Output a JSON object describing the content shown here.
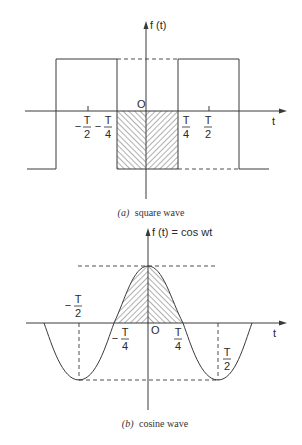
{
  "figure": {
    "panel_a": {
      "caption_letter": "(a)",
      "caption_text": "square wave",
      "y_axis_label": "f (t)",
      "x_axis_label": "t",
      "origin_label": "O",
      "ticks": {
        "neg_half": {
          "sign": "−",
          "num": "T",
          "den": "2"
        },
        "neg_quarter": {
          "sign": "−",
          "num": "T",
          "den": "4"
        },
        "pos_quarter": {
          "num": "T",
          "den": "4"
        },
        "pos_half": {
          "num": "T",
          "den": "2"
        }
      }
    },
    "panel_b": {
      "caption_letter": "(b)",
      "caption_text": "cosine wave",
      "y_axis_label": "f (t) = cos wt",
      "x_axis_label": "t",
      "origin_label": "O",
      "ticks": {
        "neg_half": {
          "sign": "−",
          "num": "T",
          "den": "2"
        },
        "neg_quarter": {
          "sign": "−",
          "num": "T",
          "den": "4"
        },
        "pos_quarter": {
          "num": "T",
          "den": "4"
        },
        "pos_half": {
          "num": "T",
          "den": "2"
        }
      }
    }
  },
  "colors": {
    "line": "#3a3a3a",
    "text": "#2a2a2a",
    "background": "#ffffff"
  }
}
